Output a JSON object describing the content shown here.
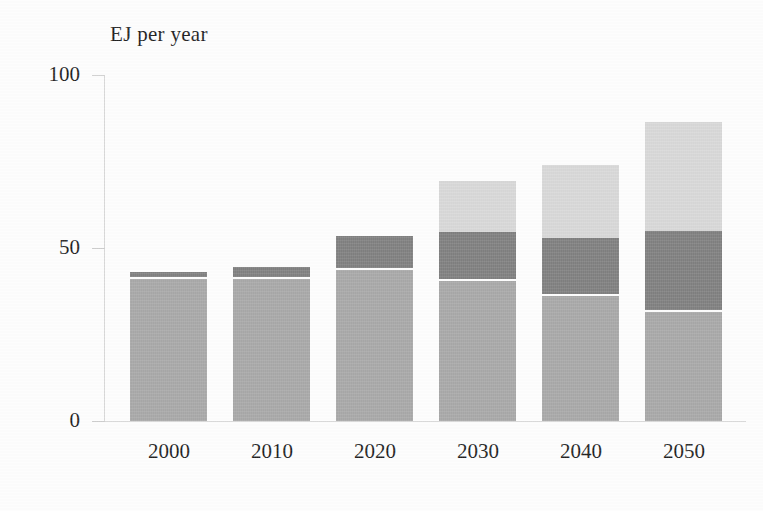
{
  "chart_data": {
    "type": "bar",
    "subtype": "stacked-bar",
    "title": "EJ per year",
    "xlabel": "",
    "ylabel": "EJ per year",
    "categories": [
      "2000",
      "2010",
      "2020",
      "2030",
      "2040",
      "2050"
    ],
    "series": [
      {
        "name": "bottom-segment",
        "color": "#a9a9a9",
        "values": [
          41,
          41,
          43.5,
          40.5,
          36,
          31.5
        ]
      },
      {
        "name": "middle-segment",
        "color": "#808080",
        "values": [
          2,
          3.5,
          10,
          14,
          17,
          23.5
        ]
      },
      {
        "name": "top-segment",
        "color": "#d9d9d9",
        "values": [
          0,
          0,
          0,
          15,
          21,
          31.5
        ]
      }
    ],
    "totals": [
      43,
      44.5,
      53.5,
      69.5,
      74,
      86.5
    ],
    "ylim": [
      0,
      100
    ],
    "y_ticks": [
      "0",
      "50",
      "100"
    ],
    "y_tick_values": [
      0,
      50,
      100
    ],
    "grid": false,
    "legend": "none"
  },
  "axes": {
    "y_ticks": [
      {
        "label": "100",
        "value": 100
      },
      {
        "label": "50",
        "value": 50
      },
      {
        "label": "0",
        "value": 0
      }
    ],
    "x_ticks": [
      {
        "label": "2000"
      },
      {
        "label": "2010"
      },
      {
        "label": "2020"
      },
      {
        "label": "2030"
      },
      {
        "label": "2040"
      },
      {
        "label": "2050"
      }
    ]
  },
  "colors": {
    "background": "#ffffff",
    "axis": "#d8d8d8",
    "text": "#1f1f1f",
    "segment_bottom": "#a9a9a9",
    "segment_middle": "#808080",
    "segment_top": "#d9d9d9"
  }
}
